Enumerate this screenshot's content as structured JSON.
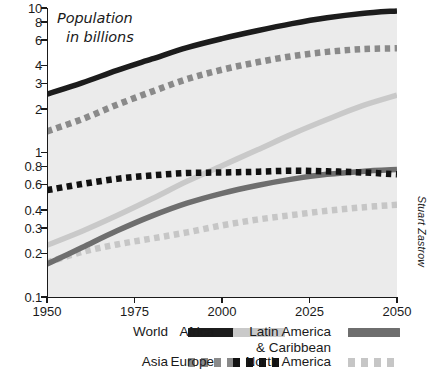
{
  "chart_data": {
    "type": "line",
    "title": "Population in billions",
    "title_line1": "Population",
    "title_line2": "in billions",
    "xlabel": "",
    "ylabel": "Population in billions",
    "yscale": "log",
    "ylim": [
      0.1,
      10
    ],
    "xlim": [
      1950,
      2050
    ],
    "grid": false,
    "legend_position": "bottom",
    "credit": "Stuart Zastrow",
    "x_ticks": [
      1950,
      1975,
      2000,
      2025,
      2050
    ],
    "x_tick_labels": [
      "1950",
      "1975",
      "2000",
      "2025",
      "2050"
    ],
    "y_ticks": [
      0.1,
      0.2,
      0.3,
      0.4,
      0.6,
      0.8,
      1,
      2,
      3,
      4,
      6,
      8,
      10
    ],
    "y_tick_labels": [
      "0.1",
      "0.2",
      "0.3",
      "0.4",
      "0.6",
      "0.8",
      "1",
      "2",
      "3",
      "4",
      "6",
      "8",
      "10"
    ],
    "x": [
      1950,
      1960,
      1970,
      1980,
      1990,
      2000,
      2010,
      2020,
      2030,
      2040,
      2050
    ],
    "series": [
      {
        "name": "World",
        "style": "solid",
        "color": "#1c1c1c",
        "values": [
          2.53,
          3.03,
          3.7,
          4.44,
          5.32,
          6.14,
          6.96,
          7.79,
          8.55,
          9.16,
          9.55
        ]
      },
      {
        "name": "Asia",
        "style": "dashed",
        "color": "#8a8a8a",
        "values": [
          1.4,
          1.7,
          2.14,
          2.64,
          3.22,
          3.74,
          4.21,
          4.64,
          4.97,
          5.19,
          5.26
        ]
      },
      {
        "name": "Africa",
        "style": "solid",
        "color": "#c9c9c9",
        "values": [
          0.228,
          0.285,
          0.366,
          0.478,
          0.632,
          0.811,
          1.04,
          1.34,
          1.69,
          2.1,
          2.49
        ]
      },
      {
        "name": "Europe",
        "style": "dashed",
        "color": "#111111",
        "values": [
          0.549,
          0.605,
          0.657,
          0.694,
          0.721,
          0.727,
          0.736,
          0.748,
          0.741,
          0.728,
          0.707
        ]
      },
      {
        "name": "Latin America & Caribbean",
        "style": "solid",
        "color": "#6e6e6e",
        "label_line1": "Latin America",
        "label_line2": "& Caribbean",
        "values": [
          0.169,
          0.22,
          0.287,
          0.364,
          0.446,
          0.522,
          0.591,
          0.654,
          0.706,
          0.74,
          0.762
        ]
      },
      {
        "name": "North America",
        "style": "dashed",
        "color": "#c6c6c6",
        "values": [
          0.173,
          0.205,
          0.231,
          0.254,
          0.28,
          0.313,
          0.343,
          0.369,
          0.395,
          0.417,
          0.435
        ]
      }
    ]
  },
  "legend": {
    "items": [
      {
        "name": "World",
        "label_line1": "World",
        "label_line2": "",
        "style": "solid",
        "color": "#1c1c1c"
      },
      {
        "name": "Africa",
        "label_line1": "Africa",
        "label_line2": "",
        "style": "solid",
        "color": "#c9c9c9"
      },
      {
        "name": "Latin America & Caribbean",
        "label_line1": "Latin America",
        "label_line2": "& Caribbean",
        "style": "solid",
        "color": "#6e6e6e"
      },
      {
        "name": "Asia",
        "label_line1": "Asia",
        "label_line2": "",
        "style": "dashed",
        "color": "#8a8a8a"
      },
      {
        "name": "Europe",
        "label_line1": "Europe",
        "label_line2": "",
        "style": "dashed",
        "color": "#111111"
      },
      {
        "name": "North America",
        "label_line1": "North America",
        "label_line2": "",
        "style": "dashed",
        "color": "#c6c6c6"
      }
    ]
  },
  "colors": {
    "background": "#ffffff",
    "plot_background": "#ebebeb",
    "axis": "#1a1a1a",
    "text": "#1a1a1a"
  }
}
